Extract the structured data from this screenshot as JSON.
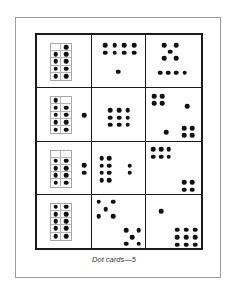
{
  "caption": "Dot cards—5",
  "colors": {
    "dot": "#111111",
    "grid_border": "#1a1a1a",
    "ten_frame_line": "#b5b5b5",
    "page_frame": "#9a9a9a"
  },
  "cards": [
    {
      "row": 1,
      "col": 1,
      "type": "ten-frame",
      "filled": [
        false,
        true,
        true,
        true,
        true,
        true,
        true,
        true,
        true,
        true
      ],
      "extra_dots": [],
      "total": 9
    },
    {
      "row": 1,
      "col": 2,
      "type": "dots",
      "dots": [
        [
          25,
          20
        ],
        [
          43,
          20
        ],
        [
          61,
          20
        ],
        [
          79,
          20
        ],
        [
          25,
          34
        ],
        [
          43,
          34
        ],
        [
          61,
          34
        ],
        [
          79,
          34
        ],
        [
          50,
          70
        ]
      ],
      "total": 9
    },
    {
      "row": 1,
      "col": 3,
      "type": "dots",
      "dots": [
        [
          33,
          20
        ],
        [
          55,
          20
        ],
        [
          44,
          32
        ],
        [
          33,
          44
        ],
        [
          55,
          44
        ],
        [
          25,
          72
        ],
        [
          40,
          72
        ],
        [
          55,
          72
        ],
        [
          70,
          72
        ]
      ],
      "total": 9
    },
    {
      "row": 2,
      "col": 1,
      "type": "ten-frame",
      "filled": [
        true,
        false,
        true,
        true,
        true,
        true,
        true,
        true,
        true,
        true
      ],
      "extra_dots": [
        [
          88,
          52
        ]
      ],
      "total": 10
    },
    {
      "row": 2,
      "col": 2,
      "type": "dots",
      "dots": [
        [
          35,
          42
        ],
        [
          51,
          42
        ],
        [
          67,
          42
        ],
        [
          35,
          56
        ],
        [
          51,
          56
        ],
        [
          67,
          56
        ],
        [
          35,
          70
        ],
        [
          51,
          70
        ],
        [
          67,
          70
        ]
      ],
      "total": 9
    },
    {
      "row": 2,
      "col": 3,
      "type": "dots",
      "dots": [
        [
          14,
          15
        ],
        [
          29,
          15
        ],
        [
          14,
          29
        ],
        [
          29,
          29
        ],
        [
          75,
          34
        ],
        [
          36,
          84
        ],
        [
          69,
          76
        ],
        [
          84,
          76
        ],
        [
          69,
          90
        ],
        [
          84,
          90
        ]
      ],
      "total": 10
    },
    {
      "row": 3,
      "col": 1,
      "type": "ten-frame",
      "filled": [
        false,
        false,
        true,
        true,
        true,
        true,
        true,
        true,
        true,
        true
      ],
      "extra_dots": [
        [
          88,
          45
        ],
        [
          88,
          60
        ]
      ],
      "total": 10
    },
    {
      "row": 3,
      "col": 2,
      "type": "dots",
      "dots": [
        [
          19,
          32
        ],
        [
          33,
          32
        ],
        [
          19,
          46
        ],
        [
          33,
          46
        ],
        [
          19,
          60
        ],
        [
          33,
          60
        ],
        [
          19,
          74
        ],
        [
          33,
          74
        ],
        [
          71,
          46
        ],
        [
          71,
          60
        ]
      ],
      "total": 10
    },
    {
      "row": 3,
      "col": 3,
      "type": "dots",
      "dots": [
        [
          13,
          15
        ],
        [
          27,
          15
        ],
        [
          41,
          15
        ],
        [
          13,
          29
        ],
        [
          27,
          29
        ],
        [
          41,
          29
        ],
        [
          69,
          78
        ],
        [
          84,
          78
        ],
        [
          69,
          92
        ],
        [
          84,
          92
        ]
      ],
      "total": 10
    },
    {
      "row": 4,
      "col": 1,
      "type": "ten-frame",
      "filled": [
        true,
        true,
        true,
        true,
        true,
        true,
        true,
        true,
        true,
        true
      ],
      "extra_dots": [],
      "total": 10
    },
    {
      "row": 4,
      "col": 2,
      "type": "dots",
      "dots": [
        [
          13,
          13
        ],
        [
          40,
          13
        ],
        [
          26,
          27
        ],
        [
          13,
          40
        ],
        [
          40,
          40
        ],
        [
          64,
          67
        ],
        [
          88,
          67
        ],
        [
          76,
          80
        ],
        [
          64,
          92
        ],
        [
          88,
          92
        ]
      ],
      "total": 10
    },
    {
      "row": 4,
      "col": 3,
      "type": "dots",
      "dots": [
        [
          27,
          31
        ],
        [
          57,
          66
        ],
        [
          73,
          66
        ],
        [
          89,
          66
        ],
        [
          57,
          80
        ],
        [
          73,
          80
        ],
        [
          89,
          80
        ],
        [
          57,
          94
        ],
        [
          73,
          94
        ],
        [
          89,
          94
        ]
      ],
      "total": 10
    }
  ]
}
